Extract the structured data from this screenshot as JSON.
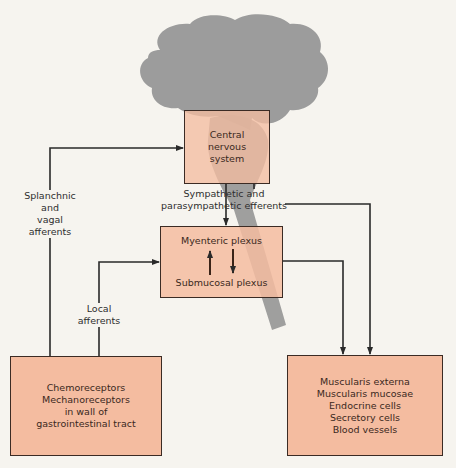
{
  "diagram": {
    "type": "flow-diagram",
    "colors": {
      "box_fill": "#f4bca0",
      "box_border": "#3b2b24",
      "brain_silhouette": "#9c9c9c",
      "background": "#f6f4ef",
      "line": "#2a2a2a"
    },
    "nodes": {
      "cns": {
        "lines": [
          "Central",
          "nervous",
          "system"
        ]
      },
      "enteric": {
        "top": "Myenteric plexus",
        "bottom": "Submucosal plexus"
      },
      "receptors": {
        "lines": [
          "Chemoreceptors",
          "Mechanoreceptors",
          "in wall of",
          "gastrointestinal tract"
        ]
      },
      "effectors": {
        "lines": [
          "Muscularis externa",
          "Muscularis mucosae",
          "Endocrine cells",
          "Secretory cells",
          "Blood vessels"
        ]
      }
    },
    "edge_labels": {
      "splanchnic": [
        "Splanchnic",
        "and",
        "vagal",
        "afferents"
      ],
      "efferents": [
        "Sympathetic and",
        "parasympathetic efferents"
      ],
      "local": [
        "Local",
        "afferents"
      ]
    }
  }
}
